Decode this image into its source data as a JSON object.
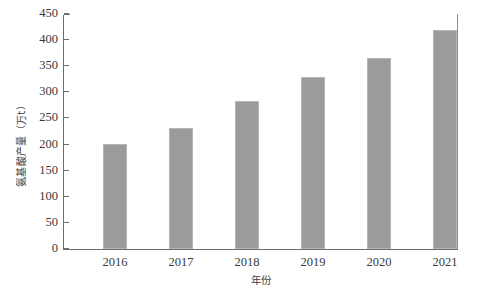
{
  "chart_data": {
    "type": "bar",
    "title": "",
    "xlabel": "年份",
    "ylabel": "氨基酸产量（万t）",
    "categories": [
      "2016",
      "2017",
      "2018",
      "2019",
      "2020",
      "2021"
    ],
    "values": [
      201,
      232,
      284,
      329,
      366,
      420
    ],
    "ylim": [
      0,
      450
    ],
    "ytick_labels": [
      "0",
      "50",
      "100",
      "150",
      "200",
      "250",
      "300",
      "350",
      "400",
      "450"
    ],
    "ytick_values": [
      0,
      50,
      100,
      150,
      200,
      250,
      300,
      350,
      400,
      450
    ],
    "grid": false,
    "legend": "none",
    "series": [
      {
        "name": "氨基酸产量",
        "values": [
          201,
          232,
          284,
          329,
          366,
          420
        ],
        "color": "#9b9b9b"
      }
    ],
    "colors": {
      "bar_fill": "#9b9b9b",
      "bar_edge": "#b6b6b6",
      "axis": "#6e6e6e",
      "text": "#3a3a3a",
      "background": "#ffffff"
    }
  }
}
